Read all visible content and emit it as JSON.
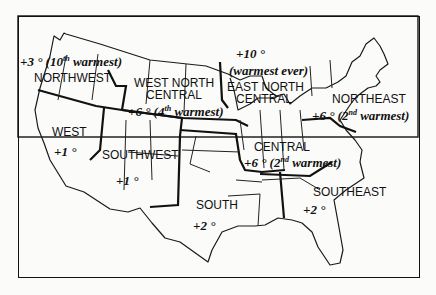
{
  "map": {
    "title": "",
    "regions": [
      {
        "name": "NORTHWEST",
        "anomaly": "+3 °",
        "rank_num": "10",
        "rank_sup": "th",
        "rank_text": "warmest"
      },
      {
        "name": "WEST NORTH CENTRAL",
        "line1": "WEST NORTH",
        "line2": "CENTRAL",
        "anomaly": "+6 °",
        "rank_num": "4",
        "rank_sup": "th",
        "rank_text": "warmest"
      },
      {
        "name": "EAST NORTH CENTRAL",
        "line1": "EAST NORTH",
        "line2": "CENTRAL",
        "anomaly": "+10 °",
        "rank_text": "(warmest ever)"
      },
      {
        "name": "NORTHEAST",
        "anomaly": "+6 °",
        "rank_num": "2",
        "rank_sup": "nd",
        "rank_text": "warmest"
      },
      {
        "name": "WEST",
        "anomaly": "+1 °"
      },
      {
        "name": "SOUTHWEST",
        "anomaly": "+1 °"
      },
      {
        "name": "CENTRAL",
        "anomaly": "+6 °",
        "rank_num": "2",
        "rank_sup": "nd",
        "rank_text": "warmest"
      },
      {
        "name": "SOUTH",
        "anomaly": "+2 °"
      },
      {
        "name": "SOUTHEAST",
        "anomaly": "+2 °"
      }
    ]
  }
}
